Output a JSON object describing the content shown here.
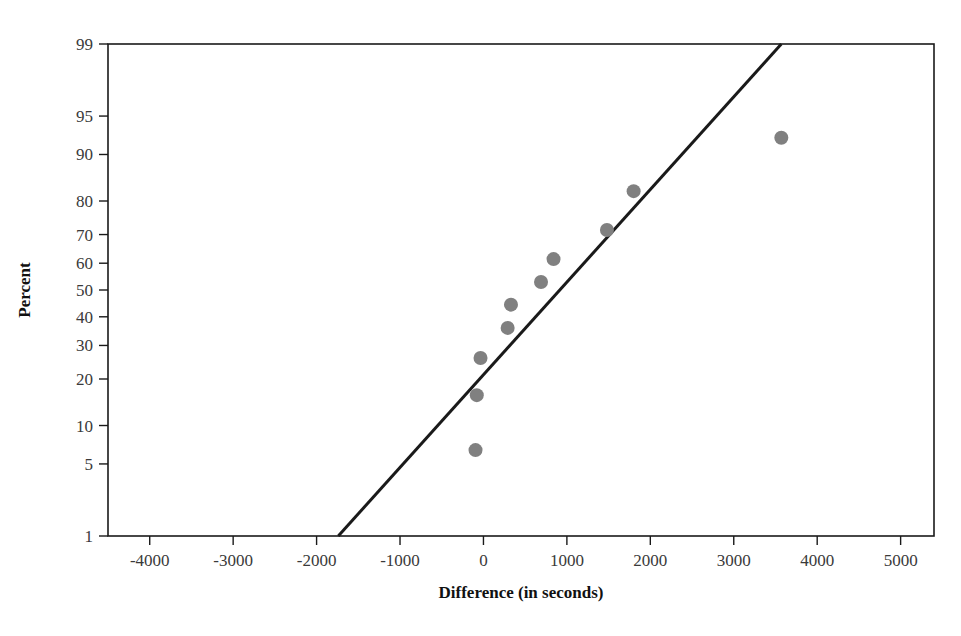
{
  "chart_data": {
    "type": "scatter",
    "title": "",
    "subtitle": "",
    "xlabel": "Difference (in seconds)",
    "ylabel": "Percent",
    "plot_kind": "normal-probability-plot",
    "grid": false,
    "legend": null,
    "xlim": [
      -4500,
      5400
    ],
    "xticks": [
      -4000,
      -3000,
      -2000,
      -1000,
      0,
      1000,
      2000,
      3000,
      4000,
      5000
    ],
    "xticklabels": [
      "-4000",
      "-3000",
      "-2000",
      "-1000",
      "0",
      "1000",
      "2000",
      "3000",
      "4000",
      "5000"
    ],
    "ylim_percent": [
      1,
      99
    ],
    "yticks": [
      1,
      5,
      10,
      20,
      30,
      40,
      50,
      60,
      70,
      80,
      90,
      95,
      99
    ],
    "yticklabels": [
      "1",
      "5",
      "10",
      "20",
      "30",
      "40",
      "50",
      "60",
      "70",
      "80",
      "90",
      "95",
      "99"
    ],
    "marker_color": "#808080",
    "line_color": "#1a1a1a",
    "points": [
      {
        "x": -95,
        "percent": 6.5
      },
      {
        "x": -80,
        "percent": 16.0
      },
      {
        "x": -35,
        "percent": 26.0
      },
      {
        "x": 290,
        "percent": 36.0
      },
      {
        "x": 330,
        "percent": 44.5
      },
      {
        "x": 690,
        "percent": 53.0
      },
      {
        "x": 840,
        "percent": 61.5
      },
      {
        "x": 1480,
        "percent": 71.5
      },
      {
        "x": 1800,
        "percent": 82.5
      },
      {
        "x": 3570,
        "percent": 92.5
      }
    ],
    "fit_line": {
      "x_start": -1740,
      "percent_start": 1,
      "x_end": 3570,
      "percent_end": 99
    }
  },
  "axes": {
    "x_title": "Difference (in seconds)",
    "y_title": "Percent"
  }
}
